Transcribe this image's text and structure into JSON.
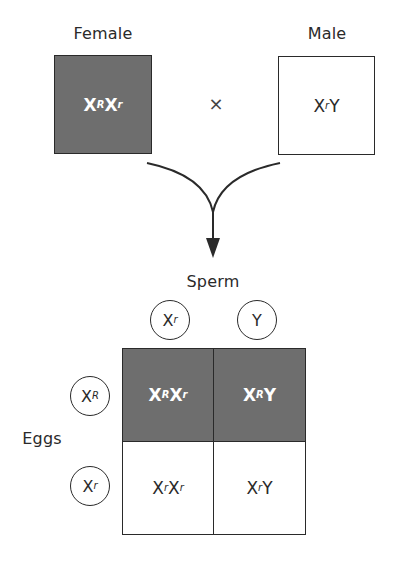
{
  "parents": {
    "female": {
      "label": "Female",
      "genotype_base1": "X",
      "genotype_sup1": "R",
      "genotype_base2": "X",
      "genotype_sup2": "r",
      "genotype_tail": "",
      "fill": "#6e6e6e"
    },
    "cross_symbol": "×",
    "male": {
      "label": "Male",
      "genotype_base1": "X",
      "genotype_sup1": "r",
      "genotype_base2": "Y",
      "genotype_sup2": "",
      "genotype_tail": "",
      "fill": "#ffffff"
    }
  },
  "arrow": {
    "icon": "merge-down-arrow"
  },
  "punnett": {
    "column_header": "Sperm",
    "row_header": "Eggs",
    "sperm": [
      {
        "base": "X",
        "sup": "r"
      },
      {
        "base": "Y",
        "sup": ""
      }
    ],
    "eggs": [
      {
        "base": "X",
        "sup": "R"
      },
      {
        "base": "X",
        "sup": "r"
      }
    ],
    "cells": [
      [
        {
          "a": "X",
          "a_sup": "R",
          "b": "X",
          "b_sup": "r",
          "shade": "dark"
        },
        {
          "a": "X",
          "a_sup": "R",
          "b": "Y",
          "b_sup": "",
          "shade": "dark"
        }
      ],
      [
        {
          "a": "X",
          "a_sup": "r",
          "b": "X",
          "b_sup": "r",
          "shade": "light"
        },
        {
          "a": "X",
          "a_sup": "r",
          "b": "Y",
          "b_sup": "",
          "shade": "light"
        }
      ]
    ]
  },
  "colors": {
    "dark_fill": "#6e6e6e",
    "light_fill": "#ffffff",
    "line": "#2a2a2a"
  }
}
